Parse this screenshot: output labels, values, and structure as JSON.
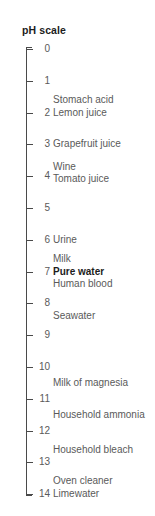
{
  "chart_data": {
    "type": "scatter",
    "title": "pH scale",
    "xlabel": "",
    "ylabel": "pH",
    "ylim": [
      0,
      14
    ],
    "grid": false,
    "legend": null,
    "orientation": "vertical-axis-descending",
    "axis_ticks": [
      {
        "value": 0,
        "label": "0"
      },
      {
        "value": 1,
        "label": "1"
      },
      {
        "value": 2,
        "label": "2"
      },
      {
        "value": 3,
        "label": "3"
      },
      {
        "value": 4,
        "label": "4"
      },
      {
        "value": 5,
        "label": "5"
      },
      {
        "value": 6,
        "label": "6"
      },
      {
        "value": 7,
        "label": "7"
      },
      {
        "value": 8,
        "label": "8"
      },
      {
        "value": 9,
        "label": "9"
      },
      {
        "value": 10,
        "label": "10"
      },
      {
        "value": 11,
        "label": "11"
      },
      {
        "value": 12,
        "label": "12"
      },
      {
        "value": 13,
        "label": "13"
      },
      {
        "value": 14,
        "label": "14"
      }
    ],
    "annotations": [
      {
        "label": "Stomach acid",
        "value": 1.6,
        "emphasis": false
      },
      {
        "label": "Lemon juice",
        "value": 2.0,
        "emphasis": false
      },
      {
        "label": "Grapefruit juice",
        "value": 3.0,
        "emphasis": false
      },
      {
        "label": "Wine",
        "value": 3.7,
        "emphasis": false
      },
      {
        "label": "Tomato juice",
        "value": 4.1,
        "emphasis": false
      },
      {
        "label": "Urine",
        "value": 6.0,
        "emphasis": false
      },
      {
        "label": "Milk",
        "value": 6.6,
        "emphasis": false
      },
      {
        "label": "Pure water",
        "value": 7.0,
        "emphasis": true
      },
      {
        "label": "Human blood",
        "value": 7.4,
        "emphasis": false
      },
      {
        "label": "Seawater",
        "value": 8.4,
        "emphasis": false
      },
      {
        "label": "Milk of magnesia",
        "value": 10.5,
        "emphasis": false
      },
      {
        "label": "Household ammonia",
        "value": 11.5,
        "emphasis": false
      },
      {
        "label": "Household bleach",
        "value": 12.6,
        "emphasis": false
      },
      {
        "label": "Oven cleaner",
        "value": 13.6,
        "emphasis": false
      },
      {
        "label": "Limewater",
        "value": 14.0,
        "emphasis": false
      }
    ],
    "colors": {
      "background": "#ffffff",
      "axis": "#4a4a4a",
      "tick_text": "#5a5a5a",
      "label_text": "#5a5a5a",
      "emphasis_text": "#1c1c1c",
      "title_text": "#1c1c1c"
    }
  },
  "geometry": {
    "axis_top_y": 49,
    "axis_step_px": 31.8
  }
}
